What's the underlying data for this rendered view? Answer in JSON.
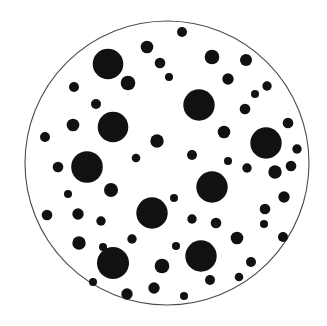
{
  "figure": {
    "name": "particle-dispersion-circle",
    "width": 327,
    "height": 326,
    "background_color": "#ffffff"
  },
  "boundary": {
    "name": "outer-circle",
    "cx": 167,
    "cy": 163,
    "r": 142,
    "stroke_color": "#4a4a4a",
    "stroke_width": 1.1,
    "fill_color": "#ffffff"
  },
  "particles": {
    "fill_color": "#111111",
    "count": 60,
    "items": [
      {
        "cx": 182,
        "cy": 32,
        "r": 5.0
      },
      {
        "cx": 147,
        "cy": 47,
        "r": 6.3
      },
      {
        "cx": 212,
        "cy": 57,
        "r": 7.3
      },
      {
        "cx": 246,
        "cy": 60,
        "r": 6.0
      },
      {
        "cx": 160,
        "cy": 63,
        "r": 5.3
      },
      {
        "cx": 108,
        "cy": 64,
        "r": 15.3
      },
      {
        "cx": 228,
        "cy": 79,
        "r": 5.7
      },
      {
        "cx": 128,
        "cy": 83,
        "r": 7.3
      },
      {
        "cx": 267,
        "cy": 86,
        "r": 4.7
      },
      {
        "cx": 74,
        "cy": 87,
        "r": 5.0
      },
      {
        "cx": 199,
        "cy": 105,
        "r": 15.7
      },
      {
        "cx": 245,
        "cy": 109,
        "r": 5.3
      },
      {
        "cx": 288,
        "cy": 123,
        "r": 5.3
      },
      {
        "cx": 73,
        "cy": 125,
        "r": 6.3
      },
      {
        "cx": 224,
        "cy": 132,
        "r": 6.3
      },
      {
        "cx": 113,
        "cy": 127,
        "r": 15.3
      },
      {
        "cx": 45,
        "cy": 137,
        "r": 5.0
      },
      {
        "cx": 157,
        "cy": 141,
        "r": 6.7
      },
      {
        "cx": 266,
        "cy": 143,
        "r": 15.7
      },
      {
        "cx": 192,
        "cy": 155,
        "r": 5.0
      },
      {
        "cx": 58,
        "cy": 167,
        "r": 5.3
      },
      {
        "cx": 87,
        "cy": 167,
        "r": 15.8
      },
      {
        "cx": 247,
        "cy": 168,
        "r": 4.7
      },
      {
        "cx": 275,
        "cy": 172,
        "r": 6.7
      },
      {
        "cx": 111,
        "cy": 190,
        "r": 7.0
      },
      {
        "cx": 212,
        "cy": 187,
        "r": 15.7
      },
      {
        "cx": 284,
        "cy": 197,
        "r": 5.7
      },
      {
        "cx": 265,
        "cy": 209,
        "r": 5.3
      },
      {
        "cx": 152,
        "cy": 213,
        "r": 15.7
      },
      {
        "cx": 47,
        "cy": 215,
        "r": 5.3
      },
      {
        "cx": 78,
        "cy": 214,
        "r": 5.7
      },
      {
        "cx": 101,
        "cy": 221,
        "r": 4.7
      },
      {
        "cx": 192,
        "cy": 219,
        "r": 4.7
      },
      {
        "cx": 216,
        "cy": 223,
        "r": 5.3
      },
      {
        "cx": 237,
        "cy": 238,
        "r": 6.3
      },
      {
        "cx": 283,
        "cy": 237,
        "r": 5.0
      },
      {
        "cx": 132,
        "cy": 239,
        "r": 4.7
      },
      {
        "cx": 79,
        "cy": 243,
        "r": 6.7
      },
      {
        "cx": 201,
        "cy": 256,
        "r": 15.7
      },
      {
        "cx": 113,
        "cy": 263,
        "r": 16.0
      },
      {
        "cx": 162,
        "cy": 266,
        "r": 7.3
      },
      {
        "cx": 251,
        "cy": 262,
        "r": 5.0
      },
      {
        "cx": 210,
        "cy": 280,
        "r": 5.0
      },
      {
        "cx": 154,
        "cy": 288,
        "r": 5.7
      },
      {
        "cx": 127,
        "cy": 294,
        "r": 5.7
      },
      {
        "cx": 96,
        "cy": 104,
        "r": 5.0
      },
      {
        "cx": 169,
        "cy": 77,
        "r": 4.0
      },
      {
        "cx": 255,
        "cy": 94,
        "r": 4.0
      },
      {
        "cx": 297,
        "cy": 149,
        "r": 4.7
      },
      {
        "cx": 291,
        "cy": 166,
        "r": 5.3
      },
      {
        "cx": 136,
        "cy": 158,
        "r": 4.3
      },
      {
        "cx": 174,
        "cy": 198,
        "r": 4.0
      },
      {
        "cx": 228,
        "cy": 161,
        "r": 4.0
      },
      {
        "cx": 68,
        "cy": 194,
        "r": 4.0
      },
      {
        "cx": 103,
        "cy": 247,
        "r": 4.0
      },
      {
        "cx": 176,
        "cy": 246,
        "r": 4.0
      },
      {
        "cx": 264,
        "cy": 224,
        "r": 4.0
      },
      {
        "cx": 239,
        "cy": 277,
        "r": 4.3
      },
      {
        "cx": 184,
        "cy": 296,
        "r": 4.0
      },
      {
        "cx": 93,
        "cy": 282,
        "r": 4.0
      }
    ]
  }
}
